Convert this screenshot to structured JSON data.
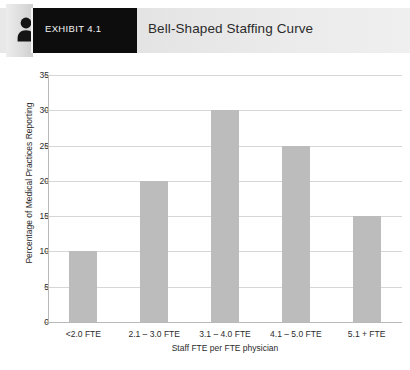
{
  "header": {
    "icon": "person-icon",
    "exhibit_tag": "EXHIBIT 4.1",
    "title": "Bell-Shaped Staffing Curve",
    "tag_bg": "#0d0d0d",
    "tag_text_color": "#f2f2f2",
    "band_color": "#e8e8e8"
  },
  "chart_data": {
    "type": "bar",
    "title": "Bell-Shaped Staffing Curve",
    "categories": [
      "<2.0 FTE",
      "2.1 – 3.0 FTE",
      "3.1 – 4.0 FTE",
      "4.1 – 5.0 FTE",
      "5.1 + FTE"
    ],
    "values": [
      10,
      20,
      30,
      25,
      15
    ],
    "xlabel": "Staff FTE per FTE physician",
    "ylabel": "Percentage of Medical Practices Reporting",
    "ylim": [
      0,
      35
    ],
    "ytick_step": 5,
    "yticks": [
      0,
      5,
      10,
      15,
      20,
      25,
      30,
      35
    ],
    "ytick_labels": [
      "0",
      "5",
      "10",
      "15",
      "20",
      "25",
      "30",
      "35"
    ],
    "grid": true,
    "grid_axis": "y",
    "legend": false,
    "bar_color": "#bcbcbc",
    "grid_color": "#d6d6d6",
    "axis_color": "#b9b9b9"
  }
}
